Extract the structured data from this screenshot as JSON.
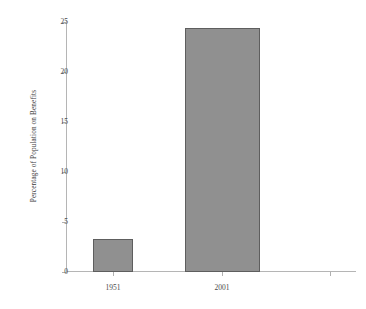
{
  "chart_data": {
    "type": "bar",
    "title": "",
    "xlabel": "",
    "ylabel": "Percentage of Population on Benefits",
    "categories": [
      "1951",
      "2001"
    ],
    "values": [
      3.3,
      24.4
    ],
    "ylim": [
      0,
      25
    ],
    "yticks": [
      0,
      5,
      10,
      15,
      20,
      25
    ],
    "ytick_labels": [
      "0",
      "5",
      "10",
      "15",
      "20",
      "25"
    ],
    "grid": false,
    "legend": null,
    "series": [
      {
        "name": "Percentage of Population on Benefits",
        "values": [
          3.3,
          24.4
        ]
      }
    ],
    "colors": {
      "bar_fill": "#909090",
      "bar_edge": "#5e5e5e",
      "axis": "#b5b5b5",
      "text": "#3a3a3a",
      "background": "#ffffff"
    }
  }
}
